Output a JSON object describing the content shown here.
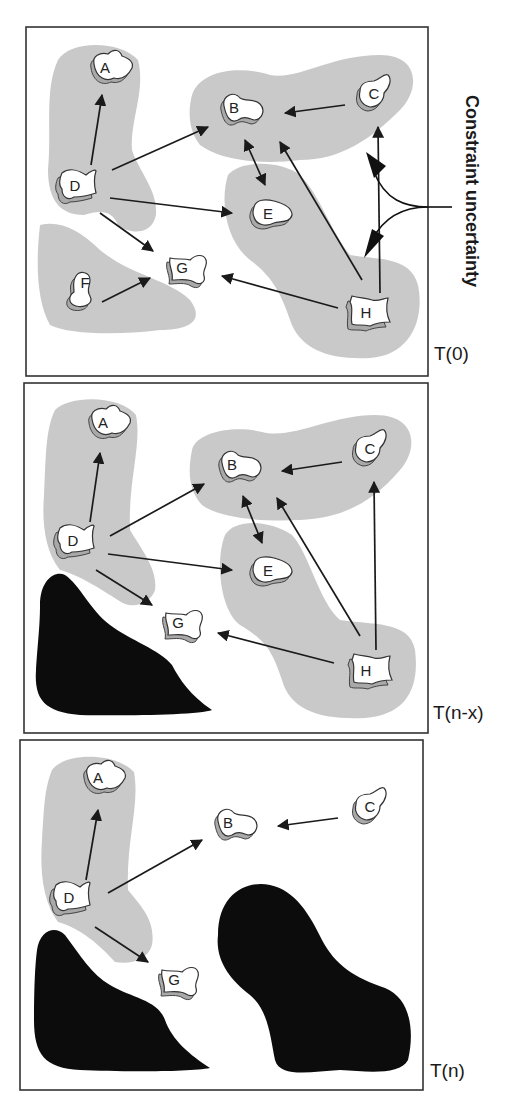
{
  "figure": {
    "annotation": "Constraint uncertainty",
    "panels": [
      {
        "id": "t0",
        "time_label": "T(0)",
        "nodes": [
          "A",
          "B",
          "C",
          "D",
          "E",
          "F",
          "G",
          "H"
        ],
        "edges": [
          [
            "D",
            "A"
          ],
          [
            "D",
            "B"
          ],
          [
            "D",
            "E"
          ],
          [
            "D",
            "G"
          ],
          [
            "C",
            "B"
          ],
          [
            "B",
            "E",
            "bidirectional"
          ],
          [
            "H",
            "B"
          ],
          [
            "H",
            "C"
          ],
          [
            "H",
            "G"
          ],
          [
            "F",
            "G"
          ]
        ],
        "obstacles": 0
      },
      {
        "id": "tn-x",
        "time_label": "T(n-x)",
        "nodes": [
          "A",
          "B",
          "C",
          "D",
          "E",
          "G",
          "H"
        ],
        "edges": [
          [
            "D",
            "A"
          ],
          [
            "D",
            "B"
          ],
          [
            "D",
            "E"
          ],
          [
            "D",
            "G"
          ],
          [
            "C",
            "B"
          ],
          [
            "B",
            "E",
            "bidirectional"
          ],
          [
            "H",
            "B"
          ],
          [
            "H",
            "C"
          ],
          [
            "H",
            "G"
          ]
        ],
        "obstacles": 1
      },
      {
        "id": "tn",
        "time_label": "T(n)",
        "nodes": [
          "A",
          "B",
          "C",
          "D",
          "G"
        ],
        "edges": [
          [
            "D",
            "A"
          ],
          [
            "D",
            "B"
          ],
          [
            "D",
            "G"
          ],
          [
            "C",
            "B"
          ]
        ],
        "obstacles": 2
      }
    ]
  },
  "labels": {
    "A": "A",
    "B": "B",
    "C": "C",
    "D": "D",
    "E": "E",
    "F": "F",
    "G": "G",
    "H": "H"
  },
  "colors": {
    "region": "#c9c9c9",
    "obstacle": "#0c0c0c",
    "node_shadow": "#a9a9a9",
    "frame": "#333333"
  }
}
